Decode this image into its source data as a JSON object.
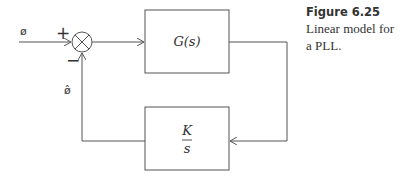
{
  "diagram": {
    "input_label": "ø",
    "feedback_label": "ø̂",
    "plus_sign": "+",
    "minus_sign": "−",
    "forward_block": "G(s)",
    "feedback_block": {
      "numerator": "K",
      "denominator": "s"
    }
  },
  "caption": {
    "title": "Figure 6.25",
    "line1": "Linear model for",
    "line2": "a PLL."
  },
  "colors": {
    "stroke": "#555555",
    "text": "#333333"
  }
}
